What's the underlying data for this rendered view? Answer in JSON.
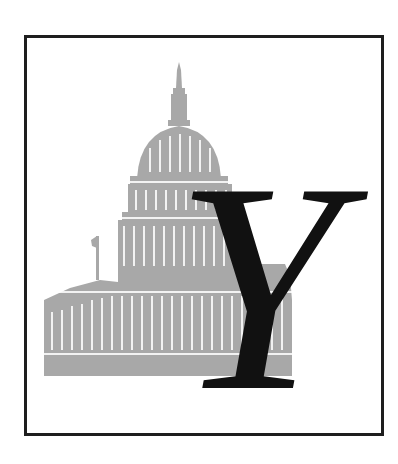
{
  "illustration": {
    "subject": "U.S. Capitol building",
    "tone_color": "#a8a8a8",
    "frame_color": "#1e1e1e"
  },
  "drop_cap": {
    "letter": "Y",
    "color": "#111111"
  }
}
